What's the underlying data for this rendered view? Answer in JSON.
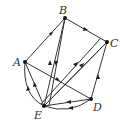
{
  "diagram": {
    "type": "directed-graph",
    "nodes": [
      {
        "id": "A",
        "label": "A",
        "x": 25,
        "y": 62,
        "lx": 13,
        "ly": 66
      },
      {
        "id": "B",
        "label": "B",
        "x": 65,
        "y": 18,
        "lx": 59,
        "ly": 14
      },
      {
        "id": "C",
        "label": "C",
        "x": 107,
        "y": 42,
        "lx": 110,
        "ly": 47
      },
      {
        "id": "D",
        "label": "D",
        "x": 91,
        "y": 99,
        "lx": 93,
        "ly": 111
      },
      {
        "id": "E",
        "label": "E",
        "x": 44,
        "y": 106,
        "lx": 34,
        "ly": 119
      }
    ],
    "edges": [
      {
        "from": "A",
        "to": "B"
      },
      {
        "from": "B",
        "to": "C"
      },
      {
        "from": "E",
        "to": "B"
      },
      {
        "from": "B",
        "to": "E"
      },
      {
        "from": "E",
        "to": "A"
      },
      {
        "from": "E",
        "to": "A",
        "curved": true
      },
      {
        "from": "A",
        "to": "D"
      },
      {
        "from": "E",
        "to": "C"
      },
      {
        "from": "E",
        "to": "C"
      },
      {
        "from": "D",
        "to": "C"
      },
      {
        "from": "D",
        "to": "E"
      },
      {
        "from": "D",
        "to": "E",
        "curved": true
      }
    ],
    "colors": {
      "edge": "#333333",
      "node": "#111111",
      "label": "#333333"
    }
  }
}
